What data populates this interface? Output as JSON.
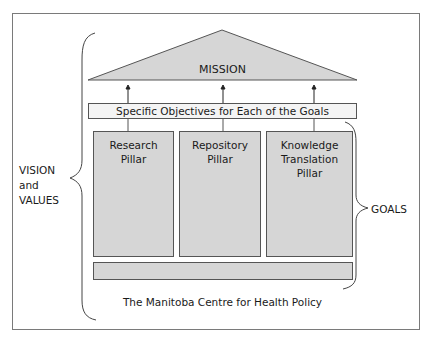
{
  "diagram": {
    "roof": {
      "label": "MISSION",
      "fill": "#d6d6d6"
    },
    "objectives_bar": {
      "label": "Specific Objectives for Each of the Goals"
    },
    "pillars": [
      {
        "line1": "Research",
        "line2": "Pillar"
      },
      {
        "line1": "Repository",
        "line2": "Pillar"
      },
      {
        "line1": "Knowledge",
        "line2": "Translation Pillar"
      }
    ],
    "foundation": {
      "label": ""
    },
    "left_brace": {
      "line1": "VISION",
      "line2": "and",
      "line3": "VALUES"
    },
    "right_brace": {
      "label": "GOALS"
    },
    "footer": {
      "label": "The Manitoba Centre for Health Policy"
    },
    "colors": {
      "fill": "#d6d6d6",
      "stroke": "#555555",
      "frame": "#7a7a7a"
    }
  }
}
